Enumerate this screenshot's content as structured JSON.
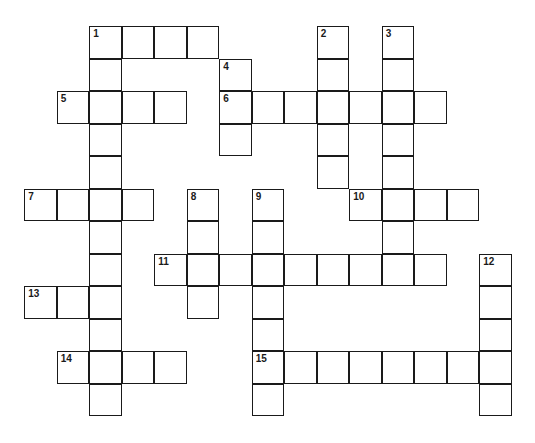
{
  "puzzle": {
    "type": "crossword",
    "origin_x": 25,
    "origin_y": 27,
    "cell_size": 32.5,
    "line_color": "#1a1a1a",
    "background": "#ffffff"
  },
  "entries": [
    {
      "number": "1",
      "direction": "across",
      "row": 0,
      "col": 2,
      "length": 4
    },
    {
      "number": "1",
      "direction": "down",
      "row": 0,
      "col": 2,
      "length": 12
    },
    {
      "number": "2",
      "direction": "down",
      "row": 0,
      "col": 9,
      "length": 5
    },
    {
      "number": "3",
      "direction": "down",
      "row": 0,
      "col": 11,
      "length": 8
    },
    {
      "number": "4",
      "direction": "down",
      "row": 1,
      "col": 6,
      "length": 3
    },
    {
      "number": "5",
      "direction": "across",
      "row": 2,
      "col": 1,
      "length": 4
    },
    {
      "number": "6",
      "direction": "across",
      "row": 2,
      "col": 6,
      "length": 7
    },
    {
      "number": "7",
      "direction": "across",
      "row": 5,
      "col": 0,
      "length": 4
    },
    {
      "number": "8",
      "direction": "down",
      "row": 5,
      "col": 5,
      "length": 4
    },
    {
      "number": "9",
      "direction": "down",
      "row": 5,
      "col": 7,
      "length": 7
    },
    {
      "number": "10",
      "direction": "across",
      "row": 5,
      "col": 10,
      "length": 4
    },
    {
      "number": "11",
      "direction": "across",
      "row": 7,
      "col": 4,
      "length": 9
    },
    {
      "number": "12",
      "direction": "down",
      "row": 7,
      "col": 14,
      "length": 5
    },
    {
      "number": "13",
      "direction": "across",
      "row": 8,
      "col": 0,
      "length": 3
    },
    {
      "number": "14",
      "direction": "across",
      "row": 10,
      "col": 1,
      "length": 4
    },
    {
      "number": "15",
      "direction": "across",
      "row": 10,
      "col": 7,
      "length": 8
    }
  ]
}
